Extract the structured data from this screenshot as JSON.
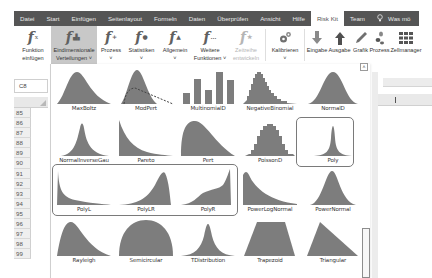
{
  "menu_tabs": [
    {
      "label": "Datei"
    },
    {
      "label": "Start"
    },
    {
      "label": "Einfügen"
    },
    {
      "label": "Seitenlayout"
    },
    {
      "label": "Formeln"
    },
    {
      "label": "Daten"
    },
    {
      "label": "Überprüfen"
    },
    {
      "label": "Ansicht"
    },
    {
      "label": "Hilfe"
    },
    {
      "label": "Risk Kit",
      "active": true
    },
    {
      "label": "Team"
    },
    {
      "label": "Was möchten Sie tun?",
      "display": "Was mö",
      "icon": "lightbulb-icon"
    }
  ],
  "ribbon": {
    "buttons": [
      {
        "id": "funktion-einfuegen",
        "line1": "Funktion",
        "line2": "einfügen",
        "icon": "fx-icon"
      },
      {
        "id": "eindimensionale-verteilungen",
        "line1": "Eindimensionale",
        "line2": "Verteilungen ˅",
        "icon": "fx-distribution-icon",
        "selected": true
      },
      {
        "id": "prozess",
        "line1": "Prozess",
        "line2": "˅",
        "icon": "fx-process-icon"
      },
      {
        "id": "statistiken",
        "line1": "Statistiken",
        "line2": "˅",
        "icon": "fx-statistics-icon"
      },
      {
        "id": "allgemein",
        "line1": "Allgemein",
        "line2": "˅",
        "icon": "fx-general-icon"
      },
      {
        "id": "weitere-funktionen",
        "line1": "Weitere",
        "line2": "Funktionen ˅",
        "icon": "fx-more-icon"
      },
      {
        "id": "zeitreihe",
        "line1": "Zeitreihe",
        "line2": "entwickeln",
        "icon": "fx-timeseries-icon",
        "disabled": true
      },
      {
        "id": "kalibrieren",
        "line1": "Kalibrieren",
        "line2": "˅",
        "icon": "gears-icon"
      },
      {
        "id": "eingabe",
        "line1": "Eingabe",
        "line2": "",
        "icon": "arrow-down-icon"
      },
      {
        "id": "ausgabe",
        "line1": "Ausgabe",
        "line2": "",
        "icon": "arrow-up-icon"
      },
      {
        "id": "grafik",
        "line1": "Grafik",
        "line2": "",
        "icon": "pencil-icon"
      },
      {
        "id": "prozess2",
        "line1": "Prozess",
        "line2": "",
        "icon": "footprints-icon"
      },
      {
        "id": "zellmanager",
        "line1": "Zellmanager",
        "line2": "",
        "icon": "grid-icon"
      }
    ]
  },
  "sheet": {
    "name_box": "C8",
    "rows": [
      "85",
      "86",
      "87",
      "88",
      "89",
      "90",
      "91",
      "92",
      "93",
      "94",
      "95",
      "96",
      "97",
      "98",
      "99"
    ]
  },
  "gallery": {
    "scroll_up_glyph": "˄",
    "items": [
      {
        "label": "MaxBoltz",
        "shape": "maxboltz"
      },
      {
        "label": "ModPert",
        "shape": "modpert"
      },
      {
        "label": "MultinomialD",
        "shape": "multinomial"
      },
      {
        "label": "NegativeBinomial",
        "shape": "negbinomial"
      },
      {
        "label": "NormalD",
        "shape": "normald"
      },
      {
        "label": "NormalInverseGau",
        "shape": "nig"
      },
      {
        "label": "Pareto",
        "shape": "pareto"
      },
      {
        "label": "Pert",
        "shape": "pert"
      },
      {
        "label": "PoissonD",
        "shape": "poissond"
      },
      {
        "label": "Poly",
        "shape": "poly",
        "highlighted": true
      },
      {
        "label": "PolyL",
        "shape": "polyl",
        "highlighted": true
      },
      {
        "label": "PolyLR",
        "shape": "polylr",
        "highlighted": true
      },
      {
        "label": "PolyR",
        "shape": "polyr",
        "highlighted": true
      },
      {
        "label": "PowerLogNormal",
        "shape": "powerlognormal"
      },
      {
        "label": "PowerNormal",
        "shape": "powernormal"
      },
      {
        "label": "Rayleigh",
        "shape": "rayleigh"
      },
      {
        "label": "Semicircular",
        "shape": "semicircular"
      },
      {
        "label": "TDistribution",
        "shape": "tdist"
      },
      {
        "label": "Trapezoid",
        "shape": "trapezoid"
      },
      {
        "label": "Triangular",
        "shape": "triangular"
      }
    ]
  },
  "colors": {
    "tabbar_bg": "#555555",
    "shape_fill": "#7d7d7d",
    "selected_button_bg": "#c8c8c8",
    "highlight_border": "#7a7a7a"
  }
}
